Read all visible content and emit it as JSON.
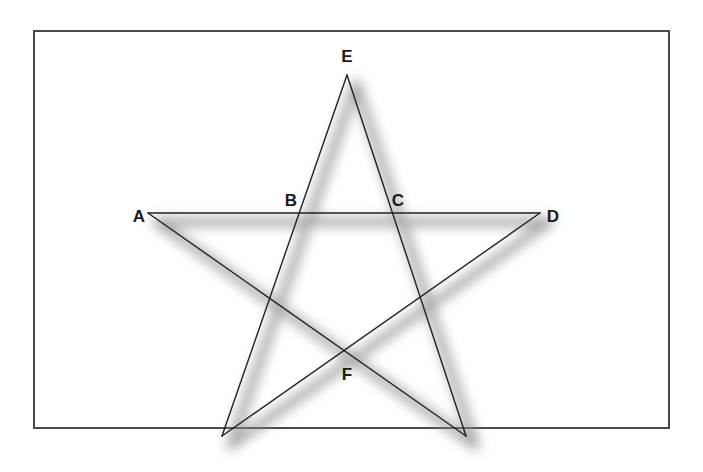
{
  "diagram": {
    "title": "",
    "type": "pentagram",
    "colors": {
      "frame": "#4a4a4a",
      "line": "#222222",
      "shadow": "#8a8a8a",
      "label": "#1a1a1a",
      "background": "#ffffff"
    },
    "points": [
      {
        "id": "E",
        "label": "E",
        "labeled": true
      },
      {
        "id": "A",
        "label": "A",
        "labeled": true
      },
      {
        "id": "D",
        "label": "D",
        "labeled": true
      },
      {
        "id": "B",
        "label": "B",
        "labeled": true
      },
      {
        "id": "C",
        "label": "C",
        "labeled": true
      },
      {
        "id": "F",
        "label": "F",
        "labeled": true
      },
      {
        "id": "P_bl",
        "label": "",
        "labeled": false
      },
      {
        "id": "P_br",
        "label": "",
        "labeled": false
      }
    ],
    "segments": [
      {
        "from": "A",
        "to": "D"
      },
      {
        "from": "E",
        "to": "P_bl"
      },
      {
        "from": "E",
        "to": "P_br"
      },
      {
        "from": "A",
        "to": "P_br"
      },
      {
        "from": "D",
        "to": "P_bl"
      }
    ],
    "drop_shadow": true
  }
}
